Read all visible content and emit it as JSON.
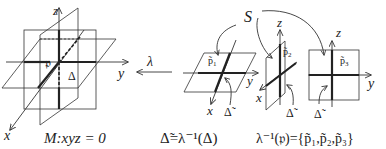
{
  "figure": {
    "left": {
      "axis_z": "z",
      "axis_y": "y",
      "axis_x": "x",
      "point": "𝔭",
      "delta": "Δ",
      "caption": "M:xyz = 0"
    },
    "map": {
      "label": "λ",
      "direction": "right-to-left"
    },
    "set_label": "S",
    "plane1": {
      "point": "p̃",
      "point_sub": "1",
      "axis_y": "y",
      "axis_x": "x",
      "delta_tilde": "Δ̃"
    },
    "plane2": {
      "point": "p̃",
      "point_sub": "2",
      "axis_z": "z",
      "axis_x": "x",
      "delta_tilde": "Δ̃"
    },
    "plane3": {
      "point": "p̃",
      "point_sub": "3",
      "axis_z": "z",
      "axis_y": "y",
      "delta_tilde": "Δ̃"
    },
    "caption_middle": "Δ̃=λ⁻¹(Δ)",
    "caption_right": "λ⁻¹(𝔭)={p̃₁,p̃₂,p̃₃}"
  }
}
